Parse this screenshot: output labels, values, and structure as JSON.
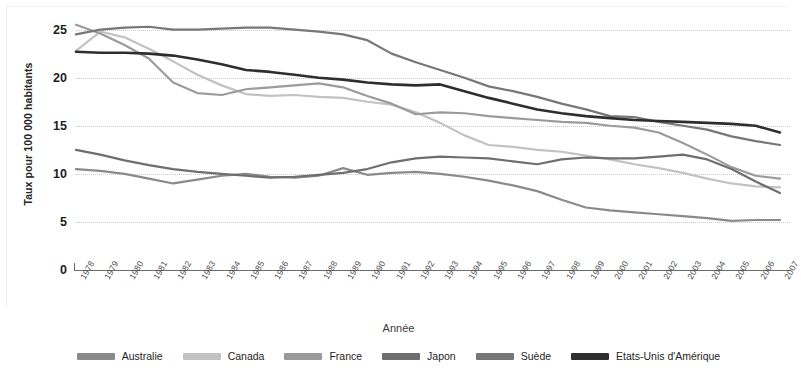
{
  "chart_data": {
    "type": "line",
    "title": "",
    "xlabel": "Année",
    "ylabel": "Taux pour 100 000 habitants",
    "xlim": [
      1978,
      2007
    ],
    "ylim": [
      0,
      26
    ],
    "yticks": [
      0,
      5,
      10,
      15,
      20,
      25
    ],
    "grid": "horizontal-dotted",
    "legend_position": "bottom",
    "x": [
      1978,
      1979,
      1980,
      1981,
      1982,
      1983,
      1984,
      1985,
      1986,
      1987,
      1988,
      1989,
      1990,
      1991,
      1992,
      1993,
      1994,
      1995,
      1996,
      1997,
      1998,
      1999,
      2000,
      2001,
      2002,
      2003,
      2004,
      2005,
      2006,
      2007
    ],
    "series": [
      {
        "name": "Australie",
        "color": "#8a8a8a",
        "values": [
          10.5,
          10.3,
          10.0,
          9.5,
          9.0,
          9.4,
          9.8,
          10.0,
          9.7,
          9.6,
          9.8,
          10.6,
          9.9,
          10.1,
          10.2,
          10.0,
          9.7,
          9.3,
          8.8,
          8.2,
          7.3,
          6.5,
          6.2,
          6.0,
          5.8,
          5.6,
          5.4,
          5.1,
          5.2,
          5.2
        ]
      },
      {
        "name": "Canada",
        "color": "#c2c2c2",
        "values": [
          22.8,
          24.8,
          24.2,
          23.0,
          21.7,
          20.3,
          19.2,
          18.3,
          18.1,
          18.2,
          18.0,
          17.9,
          17.5,
          17.2,
          16.4,
          15.3,
          14.0,
          13.0,
          12.8,
          12.5,
          12.3,
          11.9,
          11.5,
          11.0,
          10.6,
          10.1,
          9.5,
          9.0,
          8.7,
          8.6
        ]
      },
      {
        "name": "France",
        "color": "#9b9b9b",
        "values": [
          25.5,
          24.6,
          23.4,
          22.0,
          19.5,
          18.4,
          18.2,
          18.8,
          19.0,
          19.2,
          19.4,
          19.0,
          18.1,
          17.3,
          16.2,
          16.4,
          16.3,
          16.0,
          15.8,
          15.6,
          15.4,
          15.3,
          15.0,
          14.8,
          14.3,
          13.2,
          12.0,
          10.7,
          9.8,
          9.5
        ]
      },
      {
        "name": "Japon",
        "color": "#6e6e6e",
        "values": [
          12.5,
          12.0,
          11.4,
          10.9,
          10.5,
          10.2,
          10.0,
          9.8,
          9.6,
          9.7,
          9.9,
          10.1,
          10.5,
          11.2,
          11.6,
          11.8,
          11.7,
          11.6,
          11.3,
          11.0,
          11.5,
          11.7,
          11.6,
          11.6,
          11.8,
          12.0,
          11.5,
          10.5,
          9.2,
          8.0
        ]
      },
      {
        "name": "Suède",
        "color": "#777777",
        "values": [
          24.5,
          25.0,
          25.2,
          25.3,
          25.0,
          25.0,
          25.1,
          25.2,
          25.2,
          25.0,
          24.8,
          24.5,
          23.9,
          22.5,
          21.6,
          20.8,
          20.0,
          19.1,
          18.6,
          18.0,
          17.3,
          16.7,
          16.0,
          15.9,
          15.4,
          15.0,
          14.6,
          13.9,
          13.4,
          13.0
        ]
      },
      {
        "name": "Etats-Unis d'Amérique",
        "color": "#2e2e2e",
        "values": [
          22.7,
          22.6,
          22.6,
          22.5,
          22.3,
          21.9,
          21.4,
          20.8,
          20.6,
          20.3,
          20.0,
          19.8,
          19.5,
          19.3,
          19.2,
          19.3,
          18.6,
          17.9,
          17.3,
          16.7,
          16.3,
          16.0,
          15.8,
          15.6,
          15.5,
          15.4,
          15.3,
          15.2,
          15.0,
          14.3
        ]
      }
    ]
  },
  "axes": {
    "y_title": "Taux pour 100 000 habitants",
    "x_title": "Année",
    "y_ticks": [
      "0",
      "5",
      "10",
      "15",
      "20",
      "25"
    ],
    "x_ticks": [
      "1978",
      "1979",
      "1980",
      "1981",
      "1982",
      "1983",
      "1984",
      "1985",
      "1986",
      "1987",
      "1988",
      "1989",
      "1990",
      "1991",
      "1992",
      "1993",
      "1994",
      "1995",
      "1996",
      "1997",
      "1998",
      "1999",
      "2000",
      "2001",
      "2002",
      "2003",
      "2004",
      "2005",
      "2006",
      "2007"
    ]
  },
  "legend": {
    "items": [
      {
        "label": "Australie",
        "color": "#8a8a8a"
      },
      {
        "label": "Canada",
        "color": "#c2c2c2"
      },
      {
        "label": "France",
        "color": "#9b9b9b"
      },
      {
        "label": "Japon",
        "color": "#6e6e6e"
      },
      {
        "label": "Suède",
        "color": "#777777"
      },
      {
        "label": "Etats-Unis d'Amérique",
        "color": "#2e2e2e"
      }
    ]
  }
}
